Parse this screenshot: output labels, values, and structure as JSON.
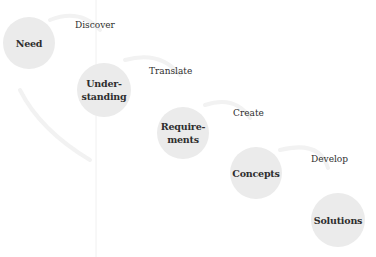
{
  "diagram": {
    "nodes": [
      {
        "id": "need",
        "label": "Need",
        "cx": 29,
        "cy": 43,
        "r": 26
      },
      {
        "id": "understanding",
        "label": "Under-\nstanding",
        "cx": 104,
        "cy": 90,
        "r": 27
      },
      {
        "id": "requirements",
        "label": "Require-\nments",
        "cx": 183,
        "cy": 133,
        "r": 26
      },
      {
        "id": "concepts",
        "label": "Concepts",
        "cx": 256,
        "cy": 173,
        "r": 26
      },
      {
        "id": "solutions",
        "label": "Solutions",
        "cx": 338,
        "cy": 220,
        "r": 27
      }
    ],
    "transitions": [
      {
        "label": "Discover",
        "x": 75,
        "y": 20
      },
      {
        "label": "Translate",
        "x": 149,
        "y": 66
      },
      {
        "label": "Create",
        "x": 233,
        "y": 108
      },
      {
        "label": "Develop",
        "x": 311,
        "y": 154
      }
    ],
    "colors": {
      "node_fill": "#ebebeb",
      "text": "#2e2e2e",
      "arrow": "#f3f3f3"
    }
  }
}
